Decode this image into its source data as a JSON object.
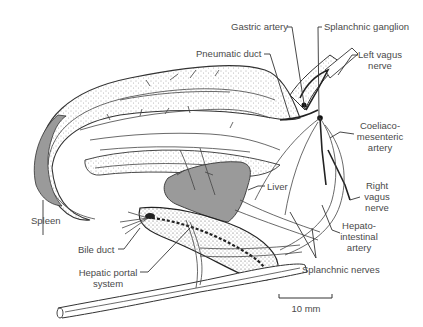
{
  "figure": {
    "type": "anatomical-diagram",
    "colors": {
      "ink": "#333333",
      "organ_fill": "#9a9a9a",
      "stipple": "#555555",
      "label_text": "#4a4a4a",
      "background": "#ffffff"
    }
  },
  "labels": {
    "gastric_artery": "Gastric artery",
    "splanchnic_ganglion": "Splanchnic ganglion",
    "pneumatic_duct": "Pneumatic duct",
    "left_vagus_1": "Left vagus",
    "left_vagus_2": "nerve",
    "coeliaco_1": "Coeliaco-",
    "coeliaco_2": "mesenteric",
    "coeliaco_3": "artery",
    "right_vagus_1": "Right",
    "right_vagus_2": "vagus",
    "right_vagus_3": "nerve",
    "hepato_1": "Hepato-",
    "hepato_2": "intestinal",
    "hepato_3": "artery",
    "splanchnic_nerves": "Splanchnic nerves",
    "liver": "Liver",
    "spleen": "Spleen",
    "bile_duct": "Bile duct",
    "hepatic_portal_1": "Hepatic portal",
    "hepatic_portal_2": "system"
  },
  "scale_bar": {
    "label": "10 mm"
  }
}
